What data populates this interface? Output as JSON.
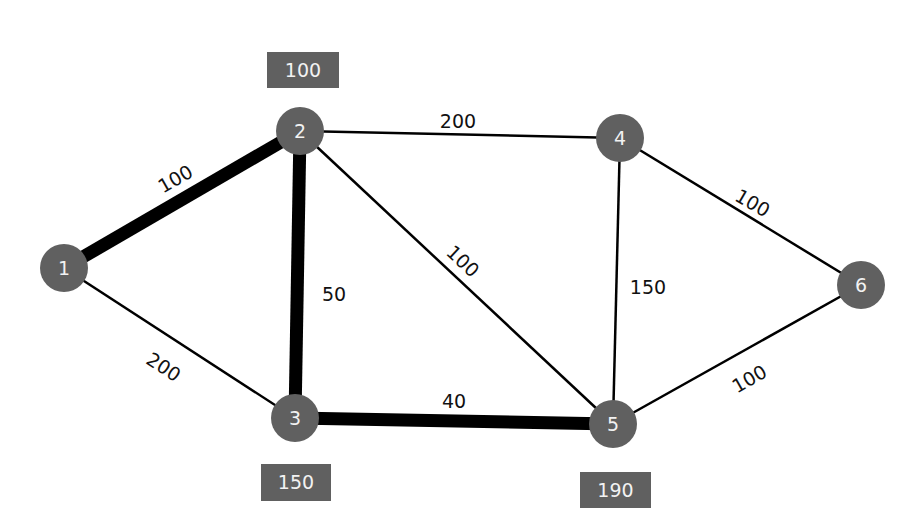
{
  "colors": {
    "node": "#606060",
    "box": "#606060",
    "edge": "#000000",
    "background": "#ffffff"
  },
  "nodes": [
    {
      "id": "1",
      "x": 64,
      "y": 268
    },
    {
      "id": "2",
      "x": 300,
      "y": 131
    },
    {
      "id": "3",
      "x": 295,
      "y": 418
    },
    {
      "id": "4",
      "x": 620,
      "y": 138
    },
    {
      "id": "5",
      "x": 613,
      "y": 424
    },
    {
      "id": "6",
      "x": 861,
      "y": 285
    }
  ],
  "edges": [
    {
      "from": "1",
      "to": "2",
      "weight": "100",
      "bold": true,
      "lx": 176,
      "ly": 180,
      "rot": -30
    },
    {
      "from": "1",
      "to": "3",
      "weight": "200",
      "bold": false,
      "lx": 163,
      "ly": 368,
      "rot": 33
    },
    {
      "from": "2",
      "to": "3",
      "weight": "50",
      "bold": true,
      "lx": 334,
      "ly": 295,
      "rot": 0
    },
    {
      "from": "2",
      "to": "4",
      "weight": "200",
      "bold": false,
      "lx": 458,
      "ly": 122,
      "rot": 0
    },
    {
      "from": "2",
      "to": "5",
      "weight": "100",
      "bold": false,
      "lx": 462,
      "ly": 262,
      "rot": 43
    },
    {
      "from": "3",
      "to": "5",
      "weight": "40",
      "bold": true,
      "lx": 454,
      "ly": 402,
      "rot": 0
    },
    {
      "from": "4",
      "to": "5",
      "weight": "150",
      "bold": false,
      "lx": 648,
      "ly": 288,
      "rot": 0
    },
    {
      "from": "4",
      "to": "6",
      "weight": "100",
      "bold": false,
      "lx": 752,
      "ly": 204,
      "rot": 30
    },
    {
      "from": "5",
      "to": "6",
      "weight": "100",
      "bold": false,
      "lx": 750,
      "ly": 380,
      "rot": -30
    }
  ],
  "boxes": [
    {
      "text": "100",
      "x": 267,
      "y": 52,
      "w": 72,
      "h": 36
    },
    {
      "text": "150",
      "x": 261,
      "y": 464,
      "w": 70,
      "h": 37
    },
    {
      "text": "190",
      "x": 580,
      "y": 472,
      "w": 71,
      "h": 36
    }
  ]
}
